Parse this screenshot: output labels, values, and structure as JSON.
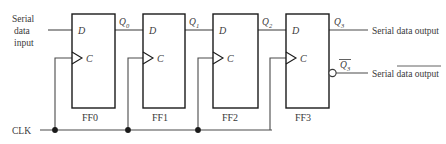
{
  "diagram": {
    "colors": {
      "wire": "#4a4a4a",
      "box_stroke": "#1a1a1a",
      "text": "#3a3a3a",
      "background": "#ffffff"
    },
    "inputs": {
      "serial_data_input": {
        "line1": "Serial",
        "line2": "data",
        "line3": "input"
      },
      "clock": {
        "label": "CLK"
      }
    },
    "flipflops": [
      {
        "name": "FF0",
        "d_pin": "D",
        "c_pin": "C",
        "q_label": "Q",
        "q_sub": "0"
      },
      {
        "name": "FF1",
        "d_pin": "D",
        "c_pin": "C",
        "q_label": "Q",
        "q_sub": "1"
      },
      {
        "name": "FF2",
        "d_pin": "D",
        "c_pin": "C",
        "q_label": "Q",
        "q_sub": "2"
      },
      {
        "name": "FF3",
        "d_pin": "D",
        "c_pin": "C",
        "q_label": "Q",
        "q_sub": "3"
      }
    ],
    "outputs": {
      "q_true": {
        "symbol": "Q",
        "sub": "3",
        "label": "Serial data output",
        "inverted": false
      },
      "q_bar": {
        "symbol": "Q",
        "sub": "3",
        "label": "Serial data output",
        "inverted": true,
        "note": "overlined"
      }
    }
  }
}
